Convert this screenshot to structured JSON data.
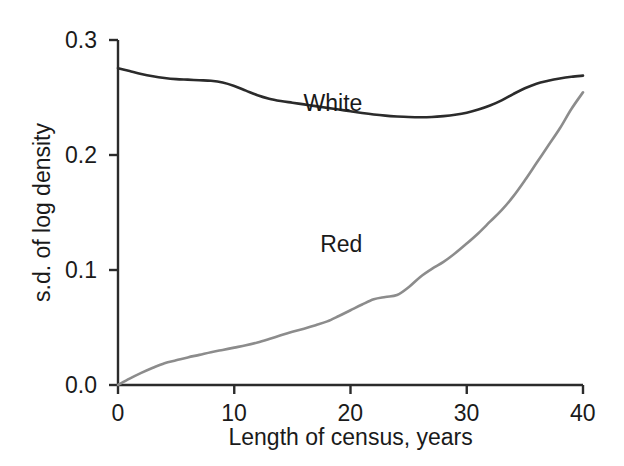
{
  "chart_data": {
    "type": "line",
    "title": "",
    "subtitle": "",
    "xlabel": "Length of census, years",
    "ylabel": "s.d. of log density",
    "xlim": [
      0,
      40
    ],
    "ylim": [
      0.0,
      0.3
    ],
    "xticks": [
      0,
      10,
      20,
      30,
      40
    ],
    "xtick_labels": [
      "0",
      "10",
      "20",
      "30",
      "40"
    ],
    "yticks": [
      0.0,
      0.1,
      0.2,
      0.3
    ],
    "ytick_labels": [
      "0.0",
      "0.1",
      "0.2",
      "0.3"
    ],
    "grid": false,
    "legend_position": "inline-annotation",
    "series": [
      {
        "name": "White",
        "label": "White",
        "color": "#2b2b2b",
        "line_width": 2.6,
        "annotation": {
          "text": "White",
          "x": 18.5,
          "y": 0.245
        },
        "x": [
          0,
          1,
          2,
          3,
          4,
          5,
          6,
          7,
          8,
          9,
          10,
          11,
          12,
          13,
          14,
          15,
          16,
          17,
          18,
          19,
          20,
          21,
          22,
          23,
          24,
          25,
          26,
          27,
          28,
          29,
          30,
          31,
          32,
          33,
          34,
          35,
          36,
          37,
          38,
          39,
          40
        ],
        "values": [
          0.2755,
          0.273,
          0.2705,
          0.2685,
          0.267,
          0.266,
          0.2655,
          0.265,
          0.2645,
          0.263,
          0.26,
          0.256,
          0.252,
          0.249,
          0.247,
          0.2455,
          0.244,
          0.2425,
          0.241,
          0.2395,
          0.238,
          0.2365,
          0.2352,
          0.2342,
          0.2335,
          0.233,
          0.2328,
          0.233,
          0.2338,
          0.235,
          0.2368,
          0.2395,
          0.243,
          0.2475,
          0.253,
          0.258,
          0.262,
          0.2645,
          0.2665,
          0.268,
          0.269
        ]
      },
      {
        "name": "Red",
        "label": "Red",
        "color": "#8c8c8c",
        "line_width": 2.6,
        "annotation": {
          "text": "Red",
          "x": 19.2,
          "y": 0.122
        },
        "x": [
          0,
          1,
          2,
          3,
          4,
          5,
          6,
          7,
          8,
          9,
          10,
          11,
          12,
          13,
          14,
          15,
          16,
          17,
          18,
          19,
          20,
          21,
          22,
          23,
          24,
          25,
          26,
          27,
          28,
          29,
          30,
          31,
          32,
          33,
          34,
          35,
          36,
          37,
          38,
          39,
          40
        ],
        "values": [
          0.0,
          0.0055,
          0.0105,
          0.015,
          0.019,
          0.0215,
          0.024,
          0.0262,
          0.0285,
          0.0305,
          0.0325,
          0.0345,
          0.037,
          0.04,
          0.0432,
          0.0462,
          0.049,
          0.052,
          0.0553,
          0.06,
          0.065,
          0.07,
          0.0745,
          0.0765,
          0.0782,
          0.085,
          0.094,
          0.101,
          0.107,
          0.1145,
          0.123,
          0.132,
          0.142,
          0.152,
          0.164,
          0.178,
          0.193,
          0.208,
          0.223,
          0.24,
          0.2545
        ]
      }
    ]
  },
  "geometry": {
    "plot_left": 118,
    "plot_right": 583,
    "plot_top": 40,
    "plot_bottom": 385
  },
  "axes": {
    "x_title": "Length of census, years",
    "y_title": "s.d. of log density"
  }
}
